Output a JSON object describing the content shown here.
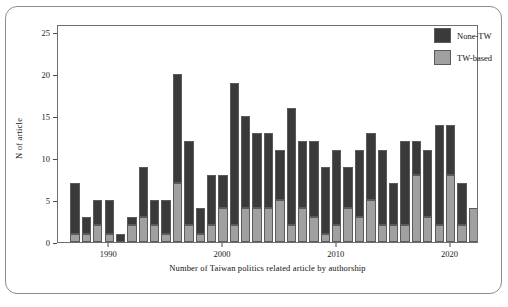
{
  "chart_data": {
    "type": "bar",
    "stacked": true,
    "title": "",
    "xlabel": "Number of Taiwan politics related article by authorship",
    "ylabel": "N of article",
    "xlim": [
      1985.5,
      2022.5
    ],
    "ylim": [
      0,
      26
    ],
    "yticks": [
      0,
      5,
      10,
      15,
      20,
      25
    ],
    "xticks": [
      1990,
      2000,
      2010,
      2020
    ],
    "grid": false,
    "legend_position": "top-right",
    "legend": [
      "None-TW",
      "TW-based"
    ],
    "colors": {
      "none_tw": "#3a3a3a",
      "tw_based": "#a0a0a0",
      "bar_border": "#5b5b5b",
      "axis": "#4a4a4a",
      "panel_border": "#6e6e6e",
      "outer_border": "#8c8c8c",
      "background": "#ffffff"
    },
    "categories": [
      1987,
      1988,
      1989,
      1990,
      1991,
      1992,
      1993,
      1994,
      1995,
      1996,
      1997,
      1998,
      1999,
      2000,
      2001,
      2002,
      2003,
      2004,
      2005,
      2006,
      2007,
      2008,
      2009,
      2010,
      2011,
      2012,
      2013,
      2014,
      2015,
      2016,
      2017,
      2018,
      2019,
      2020,
      2021,
      2022
    ],
    "series": [
      {
        "name": "TW-based",
        "values": [
          1,
          1,
          2,
          1,
          0,
          2,
          3,
          2,
          1,
          7,
          2,
          1,
          2,
          4,
          2,
          4,
          4,
          4,
          5,
          2,
          4,
          3,
          1,
          2,
          4,
          3,
          5,
          2,
          2,
          2,
          8,
          3,
          2,
          8,
          2,
          4
        ]
      },
      {
        "name": "None-TW",
        "values": [
          6,
          2,
          3,
          4,
          1,
          1,
          6,
          3,
          4,
          13,
          10,
          3,
          6,
          4,
          17,
          11,
          9,
          9,
          6,
          14,
          8,
          9,
          8,
          9,
          5,
          8,
          8,
          9,
          5,
          10,
          4,
          8,
          12,
          6,
          5,
          0
        ]
      }
    ],
    "totals": [
      7,
      3,
      5,
      5,
      1,
      3,
      9,
      5,
      5,
      20,
      12,
      4,
      8,
      8,
      19,
      15,
      13,
      13,
      11,
      16,
      12,
      12,
      9,
      11,
      9,
      11,
      13,
      11,
      7,
      12,
      12,
      11,
      14,
      14,
      7,
      4
    ]
  }
}
